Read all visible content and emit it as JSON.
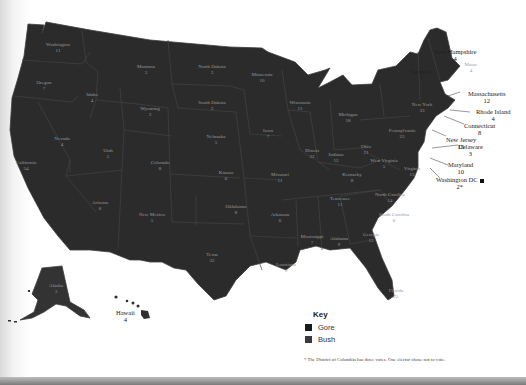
{
  "map": {
    "title": "2000 Presidential Election Electoral Votes",
    "colors": {
      "gore": "#262626",
      "bush": "#333333",
      "background": "#ffffff",
      "label": "#9a9a9a"
    },
    "states": [
      {
        "name": "Washington",
        "votes": "11",
        "winner": "gore"
      },
      {
        "name": "Oregon",
        "votes": "7",
        "winner": "gore"
      },
      {
        "name": "California",
        "votes": "54",
        "winner": "gore"
      },
      {
        "name": "Nevada",
        "votes": "4",
        "winner": "bush"
      },
      {
        "name": "Idaho",
        "votes": "4",
        "winner": "bush"
      },
      {
        "name": "Montana",
        "votes": "3",
        "winner": "bush"
      },
      {
        "name": "Wyoming",
        "votes": "3",
        "winner": "bush"
      },
      {
        "name": "Utah",
        "votes": "5",
        "winner": "bush"
      },
      {
        "name": "Arizona",
        "votes": "8",
        "winner": "bush"
      },
      {
        "name": "Colorado",
        "votes": "8",
        "winner": "bush"
      },
      {
        "name": "New Mexico",
        "votes": "5",
        "winner": "gore"
      },
      {
        "name": "North Dakota",
        "votes": "3",
        "winner": "bush"
      },
      {
        "name": "South Dakota",
        "votes": "3",
        "winner": "bush"
      },
      {
        "name": "Nebraska",
        "votes": "5",
        "winner": "bush"
      },
      {
        "name": "Kansas",
        "votes": "6",
        "winner": "bush"
      },
      {
        "name": "Oklahoma",
        "votes": "8",
        "winner": "bush"
      },
      {
        "name": "Texas",
        "votes": "32",
        "winner": "bush"
      },
      {
        "name": "Minnesota",
        "votes": "10",
        "winner": "gore"
      },
      {
        "name": "Iowa",
        "votes": "7",
        "winner": "gore"
      },
      {
        "name": "Missouri",
        "votes": "11",
        "winner": "bush"
      },
      {
        "name": "Arkansas",
        "votes": "6",
        "winner": "bush"
      },
      {
        "name": "Louisiana",
        "votes": "9",
        "winner": "bush"
      },
      {
        "name": "Wisconsin",
        "votes": "11",
        "winner": "gore"
      },
      {
        "name": "Illinois",
        "votes": "22",
        "winner": "gore"
      },
      {
        "name": "Michigan",
        "votes": "18",
        "winner": "gore"
      },
      {
        "name": "Indiana",
        "votes": "12",
        "winner": "bush"
      },
      {
        "name": "Ohio",
        "votes": "21",
        "winner": "bush"
      },
      {
        "name": "Kentucky",
        "votes": "8",
        "winner": "bush"
      },
      {
        "name": "Tennessee",
        "votes": "11",
        "winner": "bush"
      },
      {
        "name": "Mississippi",
        "votes": "7",
        "winner": "bush"
      },
      {
        "name": "Alabama",
        "votes": "9",
        "winner": "bush"
      },
      {
        "name": "Georgia",
        "votes": "13",
        "winner": "bush"
      },
      {
        "name": "Florida",
        "votes": "25",
        "winner": "bush"
      },
      {
        "name": "South Carolina",
        "votes": "8",
        "winner": "bush"
      },
      {
        "name": "North Carolina",
        "votes": "14",
        "winner": "bush"
      },
      {
        "name": "Virginia",
        "votes": "13",
        "winner": "bush"
      },
      {
        "name": "West Virginia",
        "votes": "5",
        "winner": "bush"
      },
      {
        "name": "Pennsylvania",
        "votes": "23",
        "winner": "gore"
      },
      {
        "name": "New York",
        "votes": "33",
        "winner": "gore"
      },
      {
        "name": "Maine",
        "votes": "4",
        "winner": "gore"
      },
      {
        "name": "Alaska",
        "votes": "3",
        "winner": "bush"
      },
      {
        "name": "Hawaii",
        "votes": "4",
        "winner": "gore"
      }
    ],
    "callouts": [
      {
        "name": "New Hampshire",
        "votes": "4"
      },
      {
        "name": "Vermont",
        "votes": "3"
      },
      {
        "name": "Massachusetts",
        "votes": "12"
      },
      {
        "name": "Rhode Island",
        "votes": "4"
      },
      {
        "name": "Connecticut",
        "votes": "8"
      },
      {
        "name": "New Jersey",
        "votes": "15"
      },
      {
        "name": "Delaware",
        "votes": "3"
      },
      {
        "name": "Maryland",
        "votes": "10"
      },
      {
        "name": "Washington DC",
        "votes": "2*"
      }
    ]
  },
  "key": {
    "title": "Key",
    "items": [
      {
        "label": "Gore",
        "color": "#1a1a1a"
      },
      {
        "label": "Bush",
        "color": "#3a3a3a"
      }
    ]
  },
  "footnote": "* The District of Columbia has three votes. One elector chose not to vote."
}
